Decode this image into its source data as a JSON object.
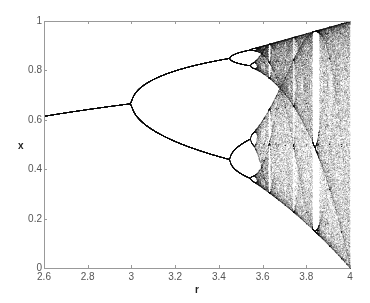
{
  "chart_data": {
    "type": "scatter",
    "title": "",
    "subtitle": "Bifurcation diagram of the logistic map x(n+1) = r·x(n)·(1 − x(n))",
    "xlabel": "r",
    "ylabel": "x",
    "xlim": [
      2.6,
      4.0
    ],
    "ylim": [
      0,
      1
    ],
    "xticks": [
      2.6,
      2.8,
      3.0,
      3.2,
      3.4,
      3.6,
      3.8,
      4.0
    ],
    "xtick_labels": [
      "2.6",
      "2.8",
      "3",
      "3.2",
      "3.4",
      "3.6",
      "3.8",
      "4"
    ],
    "yticks": [
      0,
      0.2,
      0.4,
      0.6,
      0.8,
      1.0
    ],
    "ytick_labels": [
      "0",
      "0.2",
      "0.4",
      "0.6",
      "0.8",
      "1"
    ],
    "grid": false,
    "legend": null,
    "marker_color": "#000000",
    "axis_color": "#999999",
    "features": {
      "fixed_point_at_2_6": 0.615,
      "first_bifurcation_r": 3.0,
      "first_bifurcation_x": 0.667,
      "second_bifurcation_r": 3.449,
      "period2_branches_at_3_4": [
        0.842,
        0.452
      ],
      "onset_of_chaos_r": 3.57,
      "period3_window_r": [
        3.828,
        3.857
      ],
      "chaotic_range_at_4": [
        0.0,
        1.0
      ]
    },
    "generator": {
      "r_steps": 1400,
      "transient_iterations": 300,
      "plotted_iterations": 120,
      "x0": 0.5
    }
  },
  "axes": {
    "x_label": "r",
    "y_label": "x"
  }
}
